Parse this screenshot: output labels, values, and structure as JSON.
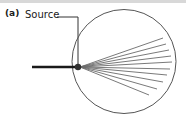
{
  "figure": {
    "panel_label": "(a)",
    "caption_absent": "",
    "background_color": "#ffffff",
    "top_band_color": "#d8d8d8"
  },
  "annotations": {
    "source_label": "Source",
    "leader_line": {
      "name": "source-leader-line",
      "color": "#333333",
      "width": 1,
      "from_x": 57,
      "from_y": 17,
      "corner_x": 78,
      "corner_y": 17,
      "to_x": 78,
      "to_y": 64
    }
  },
  "diagram": {
    "circle": {
      "name": "boundary-circle",
      "cx": 124,
      "cy": 61.5,
      "r": 52,
      "stroke": "#555555",
      "stroke_width": 1,
      "fill": "none"
    },
    "source_point": {
      "name": "source-point",
      "cx": 78,
      "cy": 67,
      "r": 3.2,
      "fill": "#303030"
    },
    "incoming_beam": {
      "name": "incoming-beam-line",
      "x1": 32,
      "y1": 67,
      "x2": 78,
      "y2": 67,
      "stroke": "#1a1a1a",
      "stroke_width": 2.4
    },
    "rays": {
      "name": "scattered-rays",
      "stroke": "#6a6a6a",
      "stroke_width": 0.9,
      "origin_x": 80,
      "origin_y": 67,
      "endpoints": [
        {
          "x": 163,
          "y": 38
        },
        {
          "x": 166,
          "y": 44
        },
        {
          "x": 169,
          "y": 50
        },
        {
          "x": 171,
          "y": 56
        },
        {
          "x": 172,
          "y": 62
        },
        {
          "x": 170,
          "y": 69
        },
        {
          "x": 167,
          "y": 75
        },
        {
          "x": 163,
          "y": 82
        },
        {
          "x": 157,
          "y": 89
        },
        {
          "x": 149,
          "y": 95
        }
      ]
    }
  }
}
